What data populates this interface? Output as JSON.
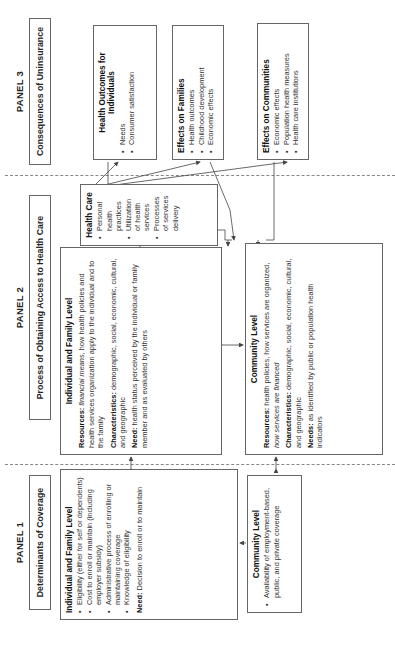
{
  "panels": [
    {
      "label": "PANEL 1",
      "title": "Determinants of Coverage",
      "individual": {
        "heading": "Individual and Family Level",
        "bullets": [
          "Eligibility (either for self or dependents)",
          "Cost to enroll or maintain (including employer subsidy)",
          "Administrative process of enrolling or maintaining coverage",
          "Knowledge of eligibility"
        ],
        "need_label": "Need:",
        "need_text": " Decision to enroll or to maintain"
      },
      "community": {
        "heading": "Community Level",
        "bullets": [
          "Availability of employment-based, public, and private coverage"
        ]
      }
    },
    {
      "label": "PANEL 2",
      "title": "Process of Obtaining Access to Health Care",
      "individual": {
        "heading": "Individual and Family Level",
        "resources_label": "Resources:",
        "resources_italic": " financial means,",
        "resources_text": " how health policies and health services organization apply to the individual and to the family",
        "characteristics_label": "Characteristics:",
        "characteristics_text": " demographic, social, economic, cultural, and geographic",
        "need_label": "Need:",
        "need_text": " health status perceived by the individual or family member and as evaluated by others"
      },
      "health_care": {
        "heading": "Health Care",
        "bullets": [
          "Personal health practices",
          "Utilization of health services",
          "Processes of services delivery"
        ]
      },
      "community": {
        "heading": "Community Level",
        "resources_label": "Resources:",
        "resources_text": " health policies, how services are organized,",
        "resources_italic": " how services are financed",
        "characteristics_label": "Characteristics:",
        "characteristics_text": " demographic, social, economic, cultural, and geographic",
        "needs_label": "Needs:",
        "needs_text": " as identified by public or population health indicators"
      }
    },
    {
      "label": "PANEL 3",
      "title": "Consequences of Uninsurance",
      "outcomes": [
        {
          "heading": "Health Outcomes for Individuals",
          "bullets": [
            "Needs",
            "Consumer satisfaction"
          ]
        },
        {
          "heading": "Effects on Families",
          "bullets": [
            "Health outcomes",
            "Childhood development",
            "Economic effects"
          ]
        },
        {
          "heading": "Effects on Communities",
          "bullets": [
            "Economic effects",
            "Population health measures",
            "Health care institutions"
          ]
        }
      ]
    }
  ],
  "orientation": "rotated 90 degrees counter-clockwise",
  "colors": {
    "border": "#666666",
    "text": "#222222",
    "divider": "#888888"
  }
}
